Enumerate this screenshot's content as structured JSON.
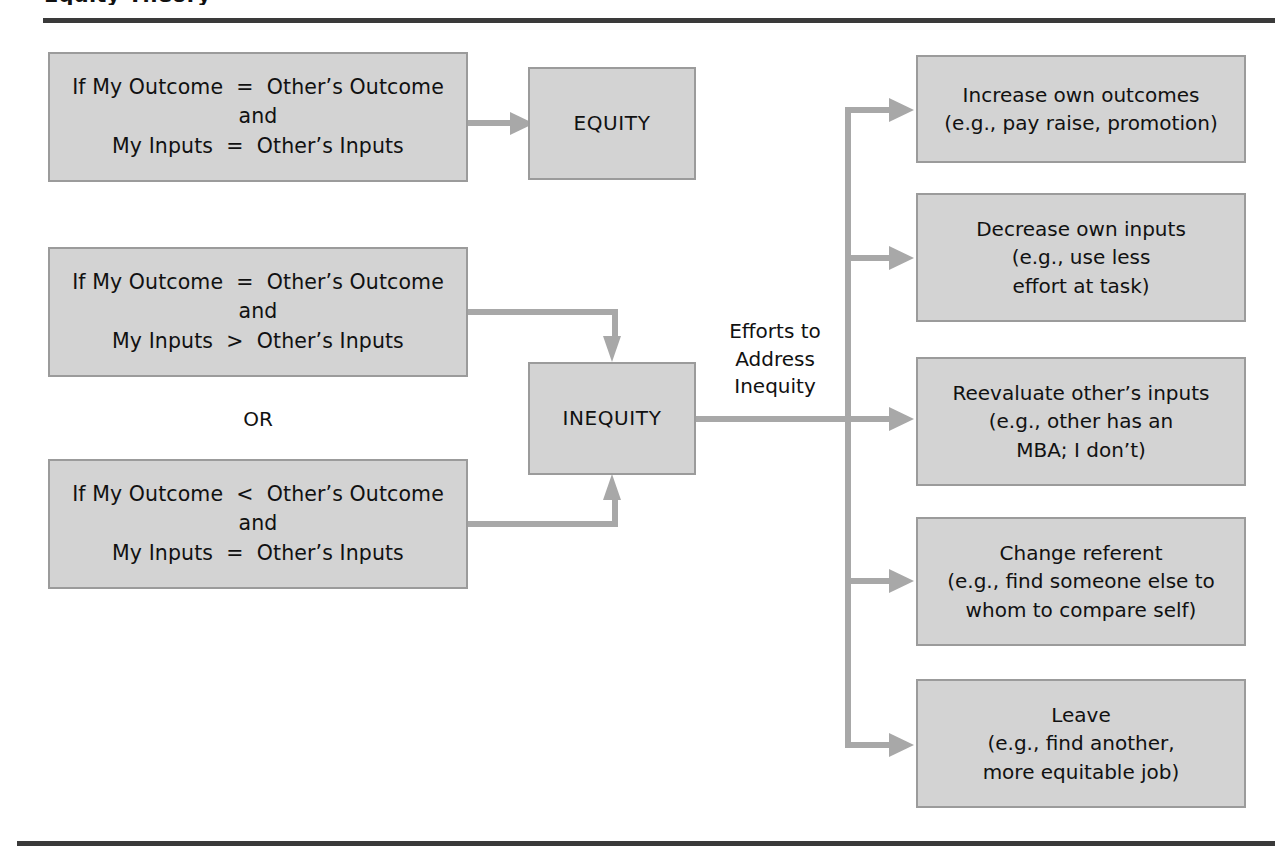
{
  "figure": {
    "title_partial": "Equity Theory",
    "accent_line_color": "#3a3a3a",
    "box_fill_color": "#d3d3d3",
    "box_border_color": "#9b9b9b",
    "connector_color": "#a8a8a8"
  },
  "conditions": [
    {
      "id": "equity-condition",
      "lines": [
        "If My Outcome  =  Other’s Outcome",
        "and",
        "My Inputs  =  Other’s Inputs"
      ]
    },
    {
      "id": "inequity-condition-over",
      "lines": [
        "If My Outcome  =  Other’s Outcome",
        "and",
        "My Inputs  >  Other’s Inputs"
      ]
    },
    {
      "id": "inequity-condition-under",
      "lines": [
        "If My Outcome  <  Other’s Outcome",
        "and",
        "My Inputs  =  Other’s Inputs"
      ]
    }
  ],
  "or_label": "OR",
  "outcomes": {
    "equity": "EQUITY",
    "inequity": "INEQUITY"
  },
  "efforts_label": {
    "lines": [
      "Efforts to",
      "Address",
      "Inequity"
    ]
  },
  "responses": [
    {
      "id": "increase-own-outcomes",
      "lines": [
        "Increase own outcomes",
        "(e.g., pay raise, promotion)"
      ]
    },
    {
      "id": "decrease-own-inputs",
      "lines": [
        "Decrease own inputs",
        "(e.g., use less",
        "effort at task)"
      ]
    },
    {
      "id": "reevaluate-others-inputs",
      "lines": [
        "Reevaluate other’s inputs",
        "(e.g., other has an",
        "MBA; I don’t)"
      ]
    },
    {
      "id": "change-referent",
      "lines": [
        "Change referent",
        "(e.g., find someone else to",
        "whom to compare self)"
      ]
    },
    {
      "id": "leave",
      "lines": [
        "Leave",
        "(e.g., find another,",
        "more equitable job)"
      ]
    }
  ]
}
